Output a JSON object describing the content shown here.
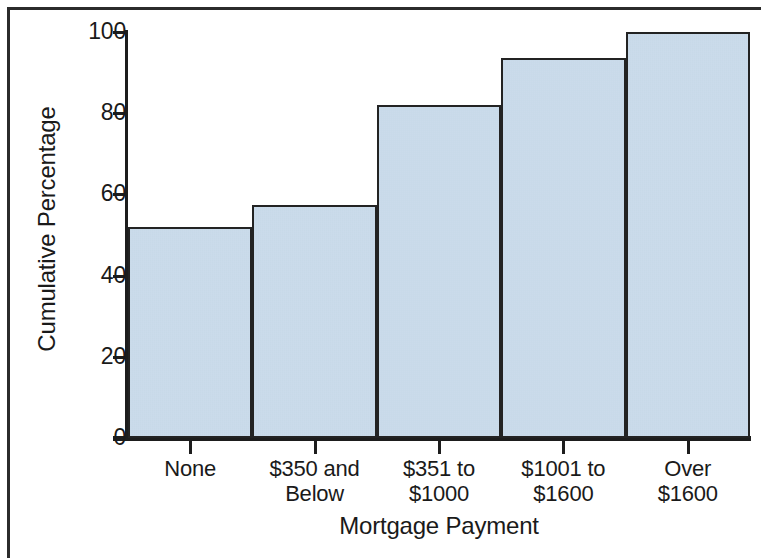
{
  "chart_data": {
    "type": "bar",
    "title": "",
    "xlabel": "Mortgage Payment",
    "ylabel": "Cumulative Percentage",
    "categories": [
      "None",
      "$350 and Below",
      "$351 to $1000",
      "$1001 to $1600",
      "Over $1600"
    ],
    "category_lines": [
      [
        "None"
      ],
      [
        "$350 and",
        "Below"
      ],
      [
        "$351 to",
        "$1000"
      ],
      [
        "$1001 to",
        "$1600"
      ],
      [
        "Over",
        "$1600"
      ]
    ],
    "values": [
      52,
      57.5,
      82,
      93.5,
      100
    ],
    "ylim": [
      0,
      100
    ],
    "yticks": [
      0,
      20,
      40,
      60,
      80,
      100
    ],
    "ytick_labels": [
      "0",
      "20",
      "40",
      "60",
      "80",
      "100"
    ],
    "grid": false,
    "legend": false,
    "bar_fill_color": "#c5d8e9",
    "bar_edge_color": "#232323",
    "axis_color": "#1d1d1d",
    "background_color": "#ffffff"
  },
  "axis": {
    "y_title": "Cumulative Percentage",
    "x_title": "Mortgage Payment"
  },
  "yticks": [
    {
      "label": "100",
      "value": 100
    },
    {
      "label": "80",
      "value": 80
    },
    {
      "label": "60",
      "value": 60
    },
    {
      "label": "40",
      "value": 40
    },
    {
      "label": "20",
      "value": 20
    },
    {
      "label": "0",
      "value": 0
    }
  ],
  "bars": [
    {
      "line1": "None",
      "line2": "",
      "value": 52
    },
    {
      "line1": "$350 and",
      "line2": "Below",
      "value": 57.5
    },
    {
      "line1": "$351 to",
      "line2": "$1000",
      "value": 82
    },
    {
      "line1": "$1001 to",
      "line2": "$1600",
      "value": 93.5
    },
    {
      "line1": "Over",
      "line2": "$1600",
      "value": 100
    }
  ]
}
